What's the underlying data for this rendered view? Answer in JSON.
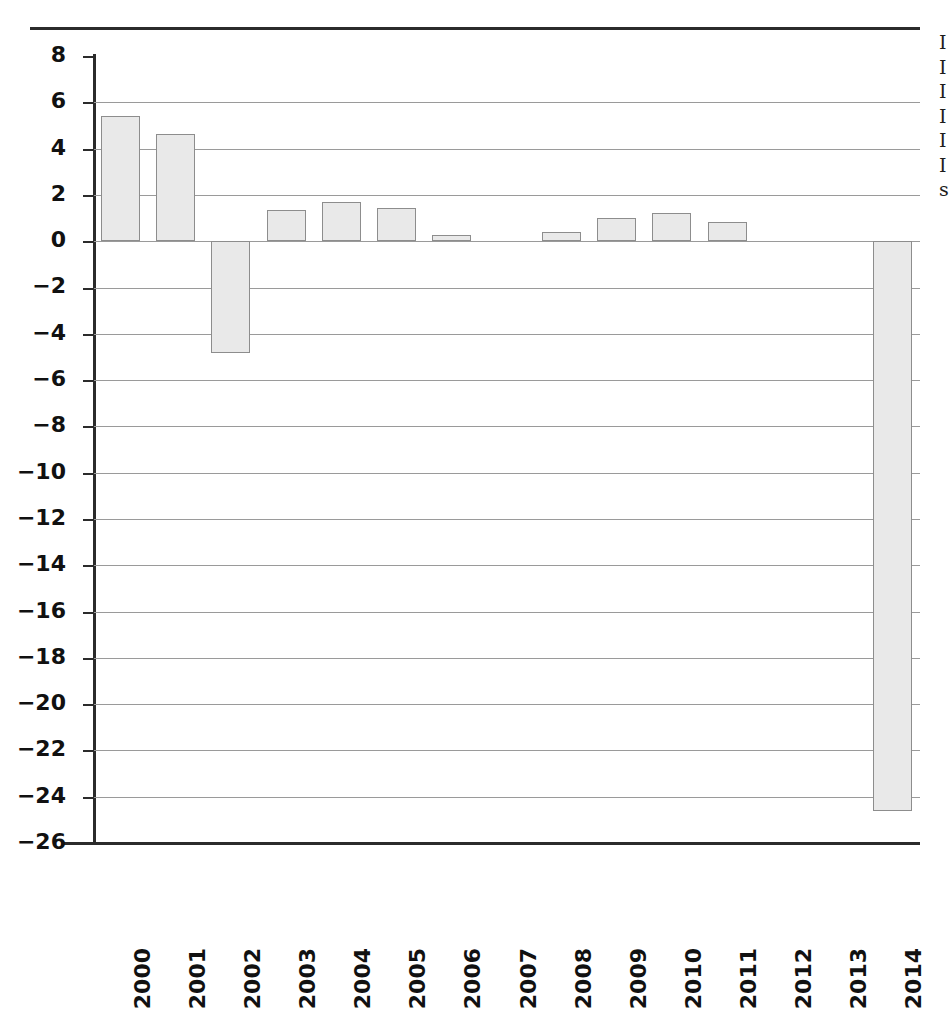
{
  "page": {
    "background_color": "#ffffff",
    "rule_color": "#2b2b2b"
  },
  "chart_data": {
    "type": "bar",
    "title": "",
    "subtitle": "",
    "xlabel": "",
    "ylabel": "",
    "categories": [
      "2000",
      "2001",
      "2002",
      "2003",
      "2004",
      "2005",
      "2006",
      "2007",
      "2008",
      "2009",
      "2010",
      "2011",
      "2012",
      "2013",
      "2014"
    ],
    "values": [
      5.4,
      4.65,
      -4.85,
      1.35,
      1.7,
      1.45,
      0.25,
      0.0,
      0.4,
      1.0,
      1.2,
      0.85,
      0.0,
      0.0,
      -24.6
    ],
    "series": [
      {
        "name": "",
        "values": [
          5.4,
          4.65,
          -4.85,
          1.35,
          1.7,
          1.45,
          0.25,
          0.0,
          0.4,
          1.0,
          1.2,
          0.85,
          0.0,
          0.0,
          -24.6
        ]
      }
    ],
    "ylim": [
      -26,
      8
    ],
    "ytick_values": [
      8,
      6,
      4,
      2,
      0,
      -2,
      -4,
      -6,
      -8,
      -10,
      -12,
      -14,
      -16,
      -18,
      -20,
      -22,
      -24,
      -26
    ],
    "ytick_labels": [
      "8",
      "6",
      "4",
      "2",
      "0",
      "−2",
      "−4",
      "−6",
      "−8",
      "−10",
      "−12",
      "−14",
      "−16",
      "−18",
      "−20",
      "−22",
      "−24",
      "−26"
    ],
    "ytick_step": 2,
    "grid": true,
    "grid_axis": "y",
    "legend": null,
    "legend_position": "none",
    "annotations": [],
    "bar_fill_color": "#e9e9e9",
    "bar_border_color": "#8d8d8d",
    "gridline_color": "#9a9a9a",
    "axis_color": "#2b2b2b",
    "xtick_label_rotation": 90
  },
  "margin_text": {
    "lines": [
      "I",
      "I",
      "I",
      "I",
      "I",
      "I",
      "s"
    ]
  }
}
